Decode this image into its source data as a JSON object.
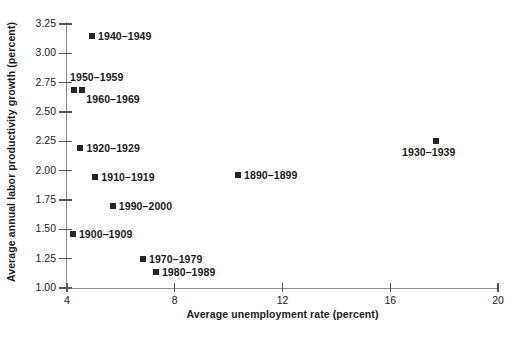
{
  "chart_data": {
    "type": "scatter",
    "title": "",
    "xlabel": "Average unemployment rate (percent)",
    "ylabel": "Average annual labor productivity growth (percent)",
    "xlim": [
      4,
      20
    ],
    "ylim": [
      1.0,
      3.25
    ],
    "xticks": [
      "4",
      "8",
      "12",
      "16",
      "20"
    ],
    "xtick_values": [
      4,
      8,
      12,
      16,
      20
    ],
    "yticks": [
      "1.00",
      "1.25",
      "1.50",
      "1.75",
      "2.00",
      "2.25",
      "2.50",
      "2.75",
      "3.00",
      "3.25"
    ],
    "ytick_values": [
      1.0,
      1.25,
      1.5,
      1.75,
      2.0,
      2.25,
      2.5,
      2.75,
      3.0,
      3.25
    ],
    "grid": false,
    "legend": "none",
    "marker_color": "#262626",
    "axis_color": "#8c8c8c",
    "points": [
      {
        "label": "1940–1949",
        "x": 4.93,
        "y": 3.15,
        "label_pos": "right"
      },
      {
        "label": "1950–1959",
        "x": 4.26,
        "y": 2.69,
        "label_pos": "above"
      },
      {
        "label": "1960–1969",
        "x": 4.57,
        "y": 2.69,
        "label_pos": "below-right"
      },
      {
        "label": "1920–1929",
        "x": 4.5,
        "y": 2.19,
        "label_pos": "right"
      },
      {
        "label": "1910–1919",
        "x": 5.05,
        "y": 1.95,
        "label_pos": "right"
      },
      {
        "label": "1990–2000",
        "x": 5.7,
        "y": 1.7,
        "label_pos": "right"
      },
      {
        "label": "1900–1909",
        "x": 4.22,
        "y": 1.46,
        "label_pos": "right"
      },
      {
        "label": "1970–1979",
        "x": 6.82,
        "y": 1.25,
        "label_pos": "right"
      },
      {
        "label": "1980–1989",
        "x": 7.3,
        "y": 1.14,
        "label_pos": "right"
      },
      {
        "label": "1890–1899",
        "x": 10.35,
        "y": 1.96,
        "label_pos": "right"
      },
      {
        "label": "1930–1939",
        "x": 17.7,
        "y": 2.25,
        "label_pos": "below-center"
      }
    ]
  }
}
